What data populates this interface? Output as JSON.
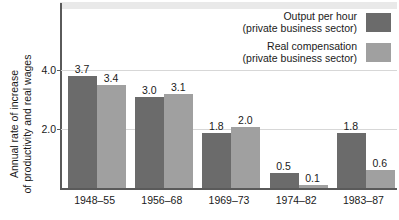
{
  "chart_data": {
    "type": "bar",
    "title": "",
    "xlabel": "",
    "ylabel": "Annual rate of increase of productivity and real wages",
    "ylabel_line1": "Annual rate of increase",
    "ylabel_line2": "of productivity and real wages",
    "categories": [
      "1948–55",
      "1956–68",
      "1969–73",
      "1974–82",
      "1983–87"
    ],
    "series": [
      {
        "name": "Output per hour (private business sector)",
        "name_line1": "Output per hour",
        "name_line2": "(private business sector)",
        "color": "#6b6b6b",
        "values": [
          3.7,
          3.0,
          1.8,
          0.5,
          1.8
        ],
        "value_labels": [
          "3.7",
          "3.0",
          "1.8",
          "0.5",
          "1.8"
        ]
      },
      {
        "name": "Real compensation (private business sector)",
        "name_line1": "Real compensation",
        "name_line2": "(private business sector)",
        "color": "#a0a0a0",
        "values": [
          3.4,
          3.1,
          2.0,
          0.1,
          0.6
        ],
        "value_labels": [
          "3.4",
          "3.1",
          "2.0",
          "0.1",
          "0.6"
        ]
      }
    ],
    "yticks": [
      2.0,
      4.0
    ],
    "ytick_labels": [
      "2.0",
      "4.0"
    ],
    "ylim": [
      0,
      6.1
    ],
    "grid": true,
    "legend_position": "top-right",
    "axis_color": "#5a5a5a",
    "grid_color": "#d7d7d7",
    "background": "#ffffff"
  }
}
